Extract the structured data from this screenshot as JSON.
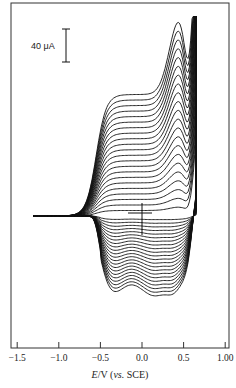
{
  "chart_data": {
    "type": "line",
    "title": "",
    "subtitle": "Repetitive cyclic voltammograms (multi-scan film growth)",
    "xlabel": "E/V (vs. SCE)",
    "xlabel_parts": {
      "italic": "E",
      "unit": "/V (",
      "vs": "vs.",
      "ref": " SCE)"
    },
    "ylabel": "",
    "x_ticks": [
      -1.5,
      -1.0,
      -0.5,
      0.0,
      0.5,
      1.0
    ],
    "x_tick_labels": [
      "−1.5",
      "−1.0",
      "−0.5",
      "0.0",
      "0.5",
      "1.00"
    ],
    "xlim": [
      -1.55,
      1.04
    ],
    "y_ticks": [],
    "scale_bar": {
      "label": "40 μA",
      "value_uA": 40
    },
    "grid": false,
    "legend": null,
    "num_cycles": 22,
    "potential_window_V": [
      -1.3,
      0.65
    ],
    "annotations": [
      "zero-current crosshair near 0.0 V"
    ],
    "series_description": {
      "anodic_peak_V": 0.45,
      "anodic_peak_current_growth_uA_per_cycle": 6,
      "cathodic_wave_V": [
        -0.45,
        0.45
      ],
      "cathodic_current_growth_uA_per_cycle": -6,
      "switching_potential_V": 0.65,
      "max_anodic_current_uA": 280,
      "max_cathodic_current_uA": -165
    }
  },
  "layout": {
    "frame": {
      "left": 11,
      "top": 3,
      "right": 229,
      "bottom": 348
    },
    "zero_current_y": 216,
    "px_per_volt": 83.2,
    "x_zero_px": 142,
    "px_per_uA": 0.7,
    "line_color": "#111111",
    "frame_color": "#333333"
  }
}
